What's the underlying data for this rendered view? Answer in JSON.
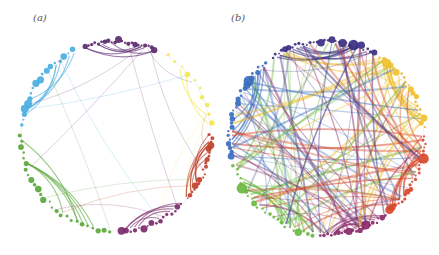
{
  "figure": {
    "panels": [
      {
        "id": "a",
        "label": "(a)",
        "center": [
          116,
          136
        ],
        "radius": 95,
        "density": "sparse",
        "groups": [
          {
            "name": "purple-top",
            "color": "#5b2a6e",
            "start_deg": 250,
            "end_deg": 295,
            "node_count": 22,
            "intra_edges": 6
          },
          {
            "name": "yellow",
            "color": "#f2e84a",
            "start_deg": 300,
            "end_deg": 355,
            "node_count": 10,
            "intra_edges": 2
          },
          {
            "name": "red",
            "color": "#c0402a",
            "start_deg": 358,
            "end_deg": 42,
            "node_count": 20,
            "intra_edges": 8
          },
          {
            "name": "purple-bottom",
            "color": "#7a2a6a",
            "start_deg": 45,
            "end_deg": 88,
            "node_count": 16,
            "intra_edges": 5
          },
          {
            "name": "green",
            "color": "#5aa83a",
            "start_deg": 92,
            "end_deg": 182,
            "node_count": 26,
            "intra_edges": 6
          },
          {
            "name": "blue",
            "color": "#4aaee0",
            "start_deg": 185,
            "end_deg": 245,
            "node_count": 18,
            "intra_edges": 5
          }
        ],
        "cross_edges": 14
      },
      {
        "id": "b",
        "label": "(b)",
        "center": [
          108,
          138
        ],
        "radius": 97,
        "density": "dense",
        "groups": [
          {
            "name": "indigo-top",
            "color": "#3a2f82",
            "start_deg": 235,
            "end_deg": 300,
            "node_count": 30,
            "intra_edges": 8
          },
          {
            "name": "yellow-orange",
            "color": "#f0c030",
            "start_deg": 302,
            "end_deg": 355,
            "node_count": 20,
            "intra_edges": 8
          },
          {
            "name": "red-orange",
            "color": "#d8482a",
            "start_deg": 358,
            "end_deg": 50,
            "node_count": 24,
            "intra_edges": 8
          },
          {
            "name": "magenta",
            "color": "#8a2a6a",
            "start_deg": 52,
            "end_deg": 95,
            "node_count": 20,
            "intra_edges": 6
          },
          {
            "name": "green",
            "color": "#6ab840",
            "start_deg": 97,
            "end_deg": 165,
            "node_count": 24,
            "intra_edges": 6
          },
          {
            "name": "blue",
            "color": "#3a6ec0",
            "start_deg": 168,
            "end_deg": 232,
            "node_count": 26,
            "intra_edges": 6
          }
        ],
        "cross_edges": 110
      }
    ]
  }
}
